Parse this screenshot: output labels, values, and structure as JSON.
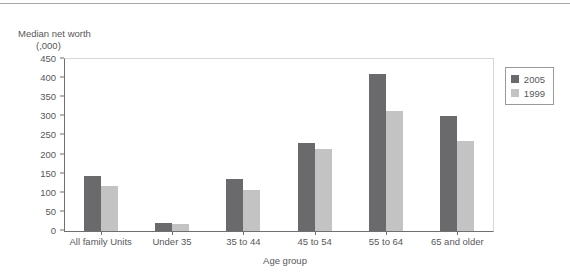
{
  "chart_data": {
    "type": "bar",
    "title": "",
    "ylabel": "Median net worth (,000)",
    "ylabel_line1": "Median net worth",
    "ylabel_line2": "(,000)",
    "xlabel": "Age group",
    "categories": [
      "All family Units",
      "Under 35",
      "35 to 44",
      "45 to 54",
      "55 to 64",
      "65 and older"
    ],
    "series": [
      {
        "name": "2005",
        "color": "#6a6a6c",
        "values": [
          145,
          20,
          135,
          230,
          410,
          300
        ]
      },
      {
        "name": "1999",
        "color": "#c3c3c4",
        "values": [
          118,
          18,
          108,
          215,
          315,
          235
        ]
      }
    ],
    "ylim": [
      0,
      450
    ],
    "yticks": [
      0,
      50,
      100,
      150,
      200,
      250,
      300,
      350,
      400,
      450
    ],
    "ytick_labels": [
      "0",
      "50",
      "100",
      "150",
      "200",
      "250",
      "300",
      "350",
      "400",
      "450"
    ],
    "grid": false,
    "legend_position": "top-right",
    "legend": [
      "2005",
      "1999"
    ]
  }
}
